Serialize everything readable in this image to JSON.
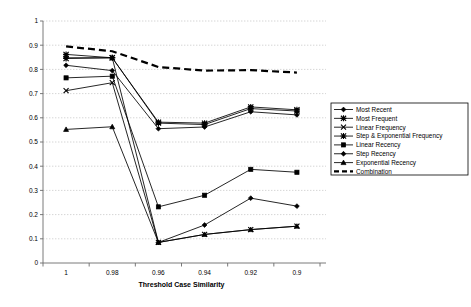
{
  "chart_data": {
    "type": "line",
    "title": "",
    "xlabel": "Threshold Case Similarity",
    "ylabel": "",
    "categories": [
      "1",
      "0.98",
      "0.96",
      "0.94",
      "0.92",
      "0.9"
    ],
    "x_tick_labels": [
      "1",
      "0.98",
      "0.96",
      "0.94",
      "0.92",
      "0.9"
    ],
    "y_tick_labels": [
      "0",
      "0.1",
      "0.2",
      "0.3",
      "0.4",
      "0.5",
      "0.6",
      "0.7",
      "0.8",
      "0.9",
      "1"
    ],
    "ylim": [
      0,
      1
    ],
    "ytick_step": 0.1,
    "grid": "horizontal-dotted",
    "legend_position": "right",
    "series": [
      {
        "name": "Most Recent",
        "marker": "diamond",
        "style": "solid",
        "values": [
          0.817,
          0.795,
          0.555,
          0.562,
          0.625,
          0.612
        ]
      },
      {
        "name": "Most Frequent",
        "marker": "star",
        "style": "solid",
        "values": [
          0.862,
          0.848,
          0.582,
          0.578,
          0.645,
          0.633
        ]
      },
      {
        "name": "Linear Frequency",
        "marker": "x",
        "style": "solid",
        "values": [
          0.712,
          0.745,
          0.085,
          0.118,
          0.138,
          0.152
        ]
      },
      {
        "name": "Step & Exponential Frequency",
        "marker": "star",
        "style": "solid",
        "values": [
          0.845,
          0.848,
          0.578,
          0.572,
          0.638,
          0.628
        ]
      },
      {
        "name": "Linear Recency",
        "marker": "square",
        "style": "solid",
        "values": [
          0.765,
          0.772,
          0.232,
          0.28,
          0.387,
          0.375
        ]
      },
      {
        "name": "Step Recency",
        "marker": "diamond",
        "style": "solid",
        "values": [
          0.848,
          0.848,
          0.085,
          0.157,
          0.268,
          0.235
        ]
      },
      {
        "name": "Exponential Recency",
        "marker": "triangle",
        "style": "solid",
        "values": [
          0.552,
          0.563,
          0.085,
          0.118,
          0.138,
          0.152
        ]
      },
      {
        "name": "Combination",
        "marker": "none",
        "style": "dashed",
        "values": [
          0.895,
          0.875,
          0.81,
          0.795,
          0.797,
          0.787
        ]
      }
    ]
  },
  "legend": {
    "entries": [
      {
        "label": "Most Recent"
      },
      {
        "label": "Most Frequent"
      },
      {
        "label": "Linear Frequency"
      },
      {
        "label": "Step & Exponential Frequency"
      },
      {
        "label": "Linear Recency"
      },
      {
        "label": "Step Recency"
      },
      {
        "label": "Exponential Recency"
      },
      {
        "label": "Combination"
      }
    ]
  },
  "axes": {
    "x_title": "Threshold Case Similarity"
  }
}
